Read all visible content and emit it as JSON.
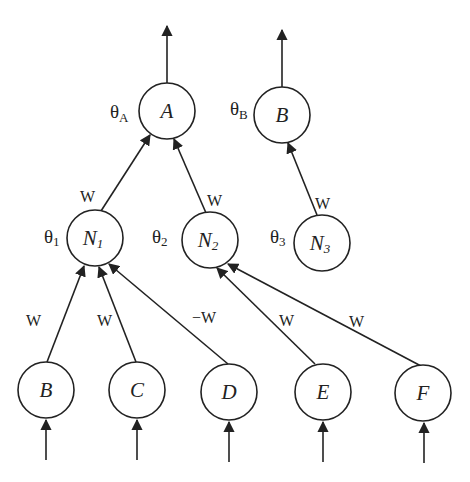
{
  "diagram": {
    "nodes": {
      "A": {
        "label": "A",
        "theta": "θ",
        "theta_sub": "A",
        "cx": 167,
        "cy": 111
      },
      "B_top": {
        "label": "B",
        "theta": "θ",
        "theta_sub": "B",
        "cx": 282,
        "cy": 115
      },
      "N1": {
        "label": "N",
        "sub": "1",
        "theta": "θ",
        "theta_sub": "1",
        "cx": 95,
        "cy": 238
      },
      "N2": {
        "label": "N",
        "sub": "2",
        "theta": "θ",
        "theta_sub": "2",
        "cx": 210,
        "cy": 240
      },
      "N3": {
        "label": "N",
        "sub": "3",
        "theta": "θ",
        "theta_sub": "3",
        "cx": 322,
        "cy": 243
      },
      "B": {
        "label": "B",
        "cx": 46,
        "cy": 390
      },
      "C": {
        "label": "C",
        "cx": 137,
        "cy": 390
      },
      "D": {
        "label": "D",
        "cx": 229,
        "cy": 392
      },
      "E": {
        "label": "E",
        "cx": 323,
        "cy": 392
      },
      "F": {
        "label": "F",
        "cx": 423,
        "cy": 393
      }
    },
    "edges": [
      {
        "from": "N1",
        "to": "A",
        "weight": "W"
      },
      {
        "from": "N2",
        "to": "A",
        "weight": "W"
      },
      {
        "from": "N3",
        "to": "B_top",
        "weight": "W"
      },
      {
        "from": "B",
        "to": "N1",
        "weight": "W"
      },
      {
        "from": "C",
        "to": "N1",
        "weight": "W"
      },
      {
        "from": "D",
        "to": "N1",
        "weight": "−W"
      },
      {
        "from": "E",
        "to": "N2",
        "weight": "W"
      },
      {
        "from": "F",
        "to": "N2",
        "weight": "W"
      }
    ],
    "weights": {
      "n1_a": "W",
      "n2_a": "W",
      "n3_b": "W",
      "b_n1": "W",
      "c_n1": "W",
      "d_n1": "−W",
      "e_n2": "W",
      "f_n2": "W"
    },
    "labels": {
      "A": "A",
      "B_top": "B",
      "N": "N",
      "N1_sub": "1",
      "N2_sub": "2",
      "N3_sub": "3",
      "B": "B",
      "C": "C",
      "D": "D",
      "E": "E",
      "F": "F",
      "theta": "θ",
      "theta_A_sub": "A",
      "theta_B_sub": "B",
      "theta_1_sub": "1",
      "theta_2_sub": "2",
      "theta_3_sub": "3"
    }
  }
}
